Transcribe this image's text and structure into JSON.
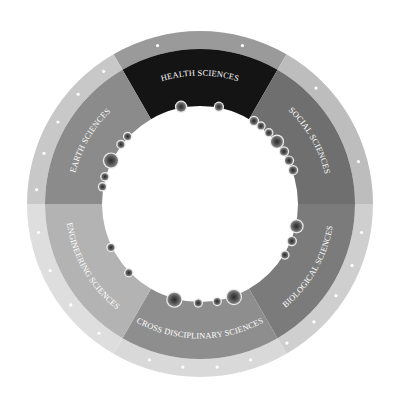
{
  "diagram": {
    "center": [
      200,
      204
    ],
    "radii": {
      "inner": 98,
      "middle": 155,
      "outer": 173
    },
    "segments": [
      {
        "id": "health",
        "label": "HEALTH SCIENCES",
        "start": -30,
        "end": 30,
        "fill": "#141414",
        "ring": "#9a9a9a",
        "ticks": [
          -15,
          15
        ],
        "bubbles": [
          {
            "a": -11,
            "r": 5
          },
          {
            "a": 11,
            "r": 4
          }
        ]
      },
      {
        "id": "social",
        "label": "SOCIAL SCIENCES",
        "start": 30,
        "end": 90,
        "fill": "#6f6f6f",
        "ring": "#bdbdbd",
        "ticks": [
          45,
          75
        ],
        "bubbles": [
          {
            "a": 33,
            "r": 4
          },
          {
            "a": 38,
            "r": 3.5
          },
          {
            "a": 44,
            "r": 3.5
          },
          {
            "a": 51,
            "r": 6
          },
          {
            "a": 58,
            "r": 4
          },
          {
            "a": 64,
            "r": 4
          },
          {
            "a": 70,
            "r": 4
          }
        ]
      },
      {
        "id": "biological",
        "label": "BIOLOGICAL SCIENCES",
        "start": 90,
        "end": 150,
        "fill": "#7b7b7b",
        "ring": "#cfcfcf",
        "ticks": [
          100,
          112,
          124,
          136,
          148
        ],
        "bubbles": [
          {
            "a": 103,
            "r": 6
          },
          {
            "a": 112,
            "r": 4
          },
          {
            "a": 121,
            "r": 3.5
          }
        ]
      },
      {
        "id": "cross",
        "label": "CROSS DISCIPLINARY SCIENCES",
        "start": 150,
        "end": 210,
        "fill": "#8e8e8e",
        "ring": "#d9d9d9",
        "ticks": [
          162,
          174,
          186,
          198
        ],
        "bubbles": [
          {
            "a": 160,
            "r": 7
          },
          {
            "a": 170,
            "r": 3.5
          },
          {
            "a": 181,
            "r": 3.5
          },
          {
            "a": 195,
            "r": 7
          }
        ]
      },
      {
        "id": "engineering",
        "label": "ENGINEERING SCIENCES",
        "start": 210,
        "end": 270,
        "fill": "#b3b3b3",
        "ring": "#dedede",
        "ticks": [
          218,
          232,
          246,
          260
        ],
        "bubbles": [
          {
            "a": 226,
            "r": 3.5
          },
          {
            "a": 244,
            "r": 3.5
          }
        ]
      },
      {
        "id": "earth",
        "label": "EARTH SCIENCES",
        "start": 270,
        "end": 330,
        "fill": "#8b8b8b",
        "ring": "#c8c8c8",
        "ticks": [
          275,
          288,
          300,
          312,
          324
        ],
        "bubbles": [
          {
            "a": 280,
            "r": 3.5
          },
          {
            "a": 286,
            "r": 3.5
          },
          {
            "a": 296,
            "r": 7
          },
          {
            "a": 307,
            "r": 3.5
          },
          {
            "a": 313,
            "r": 3.5
          }
        ]
      }
    ]
  }
}
